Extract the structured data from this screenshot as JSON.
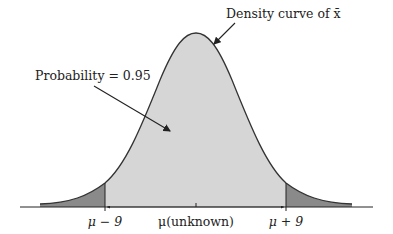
{
  "diagram": {
    "title_annotation": "Density curve of x̄",
    "probability_annotation": "Probability = 0.95",
    "axis_labels": {
      "left": "μ − 9",
      "center": "μ(unknown)",
      "right": "μ + 9"
    },
    "colors": {
      "center_fill": "#d6d6d6",
      "tail_fill": "#8a8a8a",
      "curve_stroke": "#333333",
      "axis": "#222222",
      "text": "#222222"
    }
  }
}
